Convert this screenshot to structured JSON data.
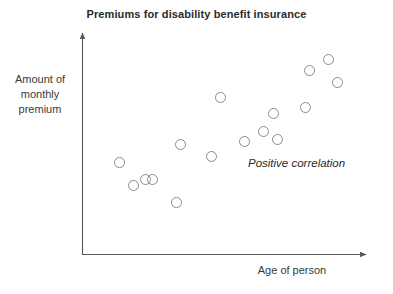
{
  "figure": {
    "width": 393,
    "height": 294,
    "background": "#ffffff",
    "axis_color": "#5a5a5a",
    "marker_color": "#8a8a90",
    "text_color": "#3a3a3a"
  },
  "chart_data": {
    "type": "scatter",
    "title": "Premiums for disability benefit insurance",
    "xlabel": "Age of person",
    "ylabel": "Amount of monthly premium",
    "ylabel_lines": [
      "Amount of",
      "monthly",
      "premium"
    ],
    "annotations": [
      {
        "text": "Positive correlation",
        "x": 248,
        "y": 157,
        "style": "italic"
      }
    ],
    "grid": false,
    "legend": null,
    "axis_style": "arrow-headed L-shaped axes, no tick marks, no numeric scale",
    "xlim": [
      0,
      100
    ],
    "ylim": [
      0,
      100
    ],
    "n_points": 15,
    "relationship": "positive correlation",
    "x": [
      13,
      17,
      22,
      24,
      34,
      32,
      40,
      56,
      61,
      63,
      68,
      67,
      78,
      84,
      88
    ],
    "y": [
      42,
      31,
      34,
      24,
      49,
      28,
      38,
      44,
      47,
      41,
      60,
      43,
      66,
      72,
      60
    ],
    "points_px": [
      {
        "x": 119,
        "y": 162
      },
      {
        "x": 133,
        "y": 185
      },
      {
        "x": 145,
        "y": 179
      },
      {
        "x": 152,
        "y": 179
      },
      {
        "x": 176,
        "y": 202
      },
      {
        "x": 180,
        "y": 144
      },
      {
        "x": 211,
        "y": 156
      },
      {
        "x": 220,
        "y": 97
      },
      {
        "x": 244,
        "y": 141
      },
      {
        "x": 263,
        "y": 131
      },
      {
        "x": 273,
        "y": 113
      },
      {
        "x": 277,
        "y": 139
      },
      {
        "x": 305,
        "y": 107
      },
      {
        "x": 309,
        "y": 70
      },
      {
        "x": 328,
        "y": 59
      },
      {
        "x": 337,
        "y": 82
      }
    ]
  }
}
